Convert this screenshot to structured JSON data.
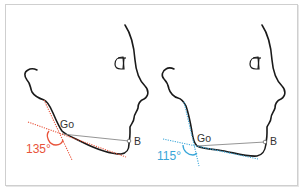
{
  "figure": {
    "panels": [
      {
        "id": "left",
        "gonion_label": "Go",
        "b_point_label": "B",
        "angle_label": "135°",
        "angle_value": 135,
        "accent_color": "#e8533a"
      },
      {
        "id": "right",
        "gonion_label": "Go",
        "b_point_label": "B",
        "angle_label": "115°",
        "angle_value": 115,
        "accent_color": "#3aa6d8"
      }
    ],
    "outline_color": "#1a1a1a",
    "reference_line_color": "#7a7a7a",
    "frame_border_color": "#cfcfcf"
  }
}
